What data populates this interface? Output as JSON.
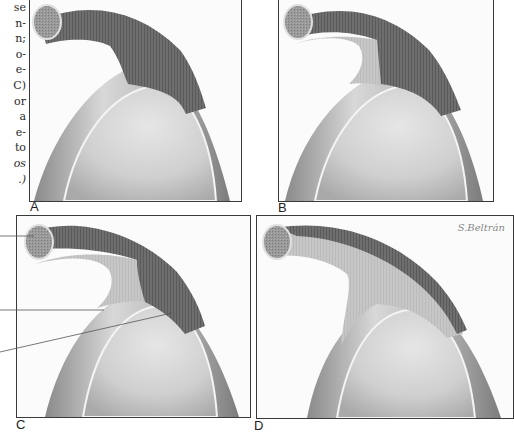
{
  "figure": {
    "caption_fragments": [
      "se",
      "n-",
      "n;",
      "o-",
      "e-",
      "C)",
      "or",
      "a",
      "e-",
      "to",
      "os",
      ".)"
    ],
    "caption_italic_indices": [
      10,
      11
    ],
    "panels": [
      {
        "id": "A",
        "label": "A",
        "tendon_dark_extent": "full",
        "description": "Tendon fully intact, dark over entire course"
      },
      {
        "id": "B",
        "label": "B",
        "tendon_dark_extent": "partial",
        "description": "Lighter segment appears at tendon base"
      },
      {
        "id": "C",
        "label": "C",
        "tendon_dark_extent": "partial-reduced",
        "description": "Lighter segment extends further, with leader lines"
      },
      {
        "id": "D",
        "label": "D",
        "tendon_dark_extent": "thin-outer-band",
        "description": "Only thin dark band remains on outer edge"
      }
    ],
    "signature": "S.Beltrán",
    "leader_lines": [
      {
        "panel": "C",
        "target": "tendon-cross-section"
      },
      {
        "panel": "C",
        "target": "light-tendon-segment"
      },
      {
        "panel": "C",
        "target": "dark-tendon-segment"
      }
    ],
    "colors": {
      "tendon_dark": "#6e6e6e",
      "tendon_light": "#c9c9c9",
      "bone": "#d2d2d2",
      "bone_highlight": "#ececec",
      "cartilage_shadow": "#8c8c8c",
      "frame": "#3a3a3a",
      "background": "#fbfbfb"
    }
  }
}
